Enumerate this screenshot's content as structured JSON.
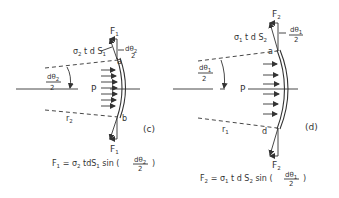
{
  "figure_c": {
    "panel_label": "(c)",
    "force_top": "F",
    "force_top_sub": "1",
    "stress_term": "σ",
    "stress_sub": "2",
    "stress_rest": " t d S",
    "stress_rest_sub": "1",
    "angle_small_num": "dθ",
    "angle_small_num_sub": "2",
    "angle_small_den": "2",
    "angle_left_num": "dθ",
    "angle_left_num_sub": "2",
    "angle_left_den": "2",
    "point_top": "a",
    "point_bottom": "b",
    "pressure_label": "P",
    "radius_label": "r",
    "radius_sub": "2",
    "force_bottom": "F",
    "force_bottom_sub": "1",
    "equation": {
      "lhs": "F",
      "lhs_sub": "1",
      "eq": " = σ",
      "sigma_sub": "2",
      "mid": " tdS",
      "ds_sub": "1",
      "sin": "  sin  (",
      "frac_num": "dθ",
      "frac_num_sub": "2",
      "frac_den": "2",
      "close": ")"
    }
  },
  "figure_d": {
    "panel_label": "(d)",
    "force_top": "F",
    "force_top_sub": "2",
    "stress_term": "σ",
    "stress_sub": "1",
    "stress_rest": " t d S",
    "stress_rest_sub": "2",
    "angle_small_num": "dθ",
    "angle_small_num_sub": "1",
    "angle_small_den": "2",
    "angle_left_num": "dθ",
    "angle_left_num_sub": "1",
    "angle_left_den": "2",
    "point_top": "a",
    "point_bottom": "d",
    "pressure_label": "P",
    "radius_label": "r",
    "radius_sub": "1",
    "force_bottom": "F",
    "force_bottom_sub": "2",
    "equation": {
      "lhs": "F",
      "lhs_sub": "2",
      "eq": " =  σ",
      "sigma_sub": "1",
      "mid": "  t d S",
      "ds_sub": "2",
      "sin": " sin  (",
      "frac_num": "dθ",
      "frac_num_sub": "1",
      "frac_den": "2",
      "close": ")"
    }
  }
}
